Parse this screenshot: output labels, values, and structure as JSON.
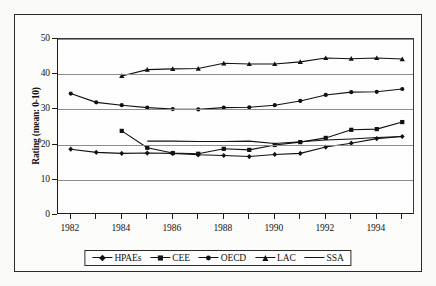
{
  "chart_data": {
    "type": "line",
    "title": "",
    "xlabel": "",
    "ylabel": "Rating (mean: 0-10)",
    "xlim": [
      1981.5,
      1995.5
    ],
    "ylim": [
      0,
      50
    ],
    "yticks": [
      0,
      10,
      20,
      30,
      40,
      50
    ],
    "xticks": [
      1982,
      1984,
      1986,
      1988,
      1990,
      1992,
      1994
    ],
    "xtick_all": [
      1982,
      1983,
      1984,
      1985,
      1986,
      1987,
      1988,
      1989,
      1990,
      1991,
      1992,
      1993,
      1994,
      1995
    ],
    "grid": "horizontal",
    "legend_position": "bottom",
    "x": [
      1982,
      1983,
      1984,
      1985,
      1986,
      1987,
      1988,
      1989,
      1990,
      1991,
      1992,
      1993,
      1994,
      1995
    ],
    "series": [
      {
        "name": "HPAEs",
        "marker": "diamond",
        "x": [
          1982,
          1983,
          1984,
          1985,
          1986,
          1987,
          1988,
          1989,
          1990,
          1991,
          1992,
          1993,
          1994,
          1995
        ],
        "values": [
          18.7,
          17.8,
          17.5,
          17.6,
          17.5,
          17.1,
          16.9,
          16.6,
          17.2,
          17.5,
          19.3,
          20.4,
          21.7,
          22.3
        ]
      },
      {
        "name": "CEE",
        "marker": "square",
        "x": [
          1984,
          1985,
          1986,
          1987,
          1988,
          1989,
          1990,
          1991,
          1992,
          1993,
          1994,
          1995
        ],
        "values": [
          23.9,
          19.1,
          17.6,
          17.4,
          18.8,
          18.5,
          19.9,
          20.7,
          21.9,
          24.2,
          24.4,
          26.4
        ]
      },
      {
        "name": "OECD",
        "marker": "circle",
        "x": [
          1982,
          1983,
          1984,
          1985,
          1986,
          1987,
          1988,
          1989,
          1990,
          1991,
          1992,
          1993,
          1994,
          1995
        ],
        "values": [
          34.5,
          32.0,
          31.2,
          30.5,
          30.1,
          30.0,
          30.5,
          30.6,
          31.2,
          32.4,
          34.1,
          34.9,
          35.0,
          35.8
        ]
      },
      {
        "name": "LAC",
        "marker": "triangle",
        "x": [
          1984,
          1985,
          1986,
          1987,
          1988,
          1989,
          1990,
          1991,
          1992,
          1993,
          1994,
          1995
        ],
        "values": [
          39.5,
          41.3,
          41.5,
          41.6,
          43.1,
          42.9,
          42.9,
          43.5,
          44.6,
          44.4,
          44.6,
          44.3
        ]
      },
      {
        "name": "SSA",
        "marker": "none",
        "x": [
          1985,
          1986,
          1987,
          1988,
          1989,
          1990,
          1991,
          1992,
          1993,
          1994,
          1995
        ],
        "values": [
          21.0,
          21.0,
          20.9,
          20.9,
          21.0,
          20.3,
          20.8,
          21.3,
          21.6,
          22.0,
          22.3
        ]
      }
    ]
  },
  "legend": {
    "items": [
      {
        "label": "HPAEs",
        "marker": "diamond"
      },
      {
        "label": "CEE",
        "marker": "square"
      },
      {
        "label": "OECD",
        "marker": "circle"
      },
      {
        "label": "LAC",
        "marker": "triangle"
      },
      {
        "label": "SSA",
        "marker": "none"
      }
    ]
  },
  "axes": {
    "y_axis_title": "Rating (mean: 0-10)",
    "y_tick_labels": [
      "0",
      "10",
      "20",
      "30",
      "40",
      "50"
    ],
    "x_tick_labels": [
      "1982",
      "1984",
      "1986",
      "1988",
      "1990",
      "1992",
      "1994"
    ]
  }
}
